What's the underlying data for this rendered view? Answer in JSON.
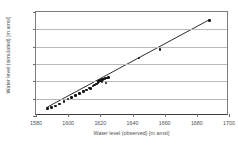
{
  "chart_data": {
    "type": "scatter",
    "title": "",
    "xlabel": "Water level (observed) [m amsl]",
    "ylabel": "Water level (simulated) [m amsl]",
    "xlim": [
      1580,
      1700
    ],
    "ylim": [
      1580,
      1700
    ],
    "xticks": [
      1580,
      1600,
      1620,
      1640,
      1660,
      1680,
      1700
    ],
    "yticks": [
      1580,
      1600,
      1620,
      1640,
      1660,
      1680,
      1700
    ],
    "xtick_labels": [
      "1580",
      "1600",
      "1620",
      "1640",
      "1660",
      "1680",
      "1700"
    ],
    "ytick_labels": [
      "1580",
      "1600",
      "1620",
      "1640",
      "1660",
      "1680",
      "1700"
    ],
    "grid": "horizontal",
    "legend": "none",
    "marker_color": "#111111",
    "line_color": "#111111",
    "series": [
      {
        "name": "observed vs simulated",
        "marker": "filled-diamond",
        "points": [
          [
            1587.0,
            1588.5
          ],
          [
            1589.5,
            1590.0
          ],
          [
            1592.0,
            1591.5
          ],
          [
            1594.5,
            1594.0
          ],
          [
            1597.5,
            1597.0
          ],
          [
            1600.0,
            1599.5
          ],
          [
            1602.0,
            1601.5
          ],
          [
            1604.5,
            1603.5
          ],
          [
            1607.0,
            1606.0
          ],
          [
            1609.5,
            1608.5
          ],
          [
            1611.5,
            1610.0
          ],
          [
            1613.0,
            1612.5
          ],
          [
            1614.0,
            1611.5
          ],
          [
            1615.5,
            1614.5
          ],
          [
            1616.5,
            1616.0
          ],
          [
            1617.5,
            1617.0
          ],
          [
            1618.5,
            1618.0
          ],
          [
            1619.0,
            1619.5
          ],
          [
            1619.5,
            1620.5
          ],
          [
            1620.0,
            1621.0
          ],
          [
            1620.5,
            1621.5
          ],
          [
            1621.0,
            1619.0
          ],
          [
            1621.5,
            1622.0
          ],
          [
            1622.0,
            1622.5
          ],
          [
            1623.0,
            1623.0
          ],
          [
            1623.5,
            1618.0
          ],
          [
            1624.0,
            1624.0
          ],
          [
            1625.0,
            1624.5
          ],
          [
            1644.0,
            1647.0
          ],
          [
            1657.0,
            1657.0
          ],
          [
            1688.0,
            1690.5
          ]
        ]
      }
    ],
    "fit_line": {
      "name": "1:1 trend line",
      "from": [
        1587.0,
        1588.0
      ],
      "to": [
        1688.5,
        1690.5
      ]
    }
  }
}
